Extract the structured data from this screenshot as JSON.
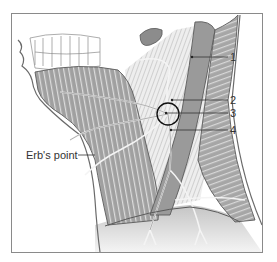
{
  "figure": {
    "labels": [
      {
        "id": "1",
        "text": "1"
      },
      {
        "id": "2",
        "text": "2"
      },
      {
        "id": "3",
        "text": "3"
      },
      {
        "id": "4",
        "text": "4"
      }
    ],
    "erbs_point": {
      "text": "Erb's point"
    }
  },
  "colors": {
    "muscle": "#a8a8a8",
    "muscle_dark": "#8c8c8c",
    "scm": "#9a9a9a",
    "nerve": "#f2f2f2",
    "outline": "#5a5a5a",
    "background_tissue": "#d9d9d9",
    "frame": "#8a8a8a",
    "circle": "#111111"
  }
}
